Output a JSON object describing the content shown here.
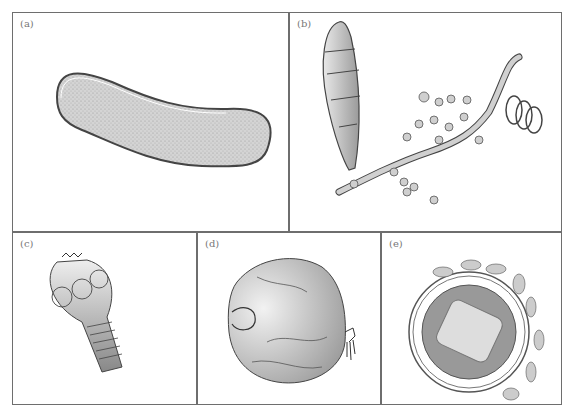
{
  "figure": {
    "panels": [
      {
        "id": "a",
        "label": "(a)",
        "subject": "rod-shaped bacterium"
      },
      {
        "id": "b",
        "label": "(b)",
        "subject": "fungal hyphae with spores"
      },
      {
        "id": "c",
        "label": "(c)",
        "subject": "tapeworm scolex"
      },
      {
        "id": "d",
        "label": "(d)",
        "subject": "protozoan / mite-like organism"
      },
      {
        "id": "e",
        "label": "(e)",
        "subject": "enveloped virus particle"
      }
    ]
  },
  "colors": {
    "frame": "#6e6e6e",
    "fill": "#cfcfcf",
    "dark": "#9a9a9a",
    "label": "#777777"
  }
}
